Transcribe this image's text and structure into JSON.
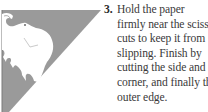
{
  "illustration": {
    "icon": "elephant-cutout-icon",
    "colors": {
      "paper": "#9a9a9a",
      "cutout": "#ffffff",
      "outline": "#8a8a8a"
    }
  },
  "instruction": {
    "step_number": "3.",
    "lines": [
      "Hold the paper",
      "firmly near the scissor",
      "cuts to keep it from",
      "slipping. Finish by",
      "cutting the side and",
      "corner, and finally the",
      "outer edge."
    ]
  }
}
